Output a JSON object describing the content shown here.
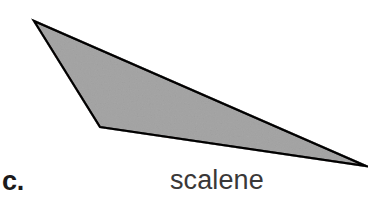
{
  "figure": {
    "background_color": "#ffffff",
    "part_letter": "c.",
    "caption": "scalene",
    "shape": {
      "name": "scalene-triangle",
      "fill_color": "#cdcdcd",
      "stroke_color": "#282626",
      "stroke_width": 2.2,
      "vertices": [
        {
          "label": "top-left-apex",
          "x": 34,
          "y": 21
        },
        {
          "label": "bottom-left-vertex",
          "x": 100,
          "y": 127
        },
        {
          "label": "right-apex",
          "x": 366,
          "y": 166
        }
      ],
      "points_attr": "34,21 100,127 366,166"
    }
  }
}
